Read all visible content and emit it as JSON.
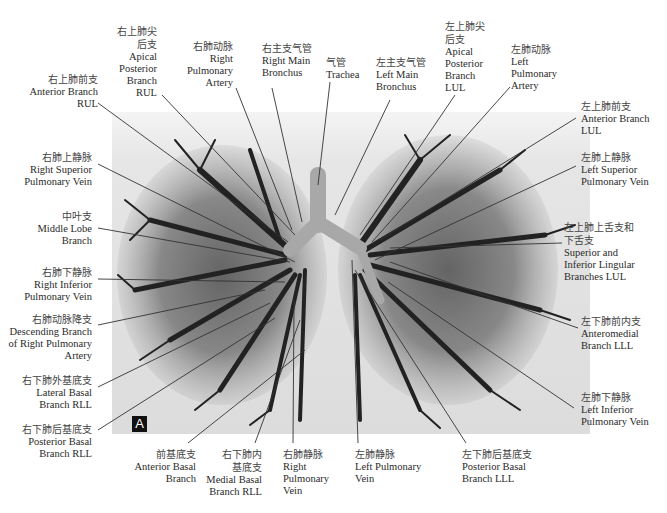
{
  "figure": {
    "panel_letter": "A",
    "colors": {
      "background": "#ffffff",
      "photo_bg": "#e4e4e4",
      "cast_dark": "#1e1e1e",
      "cast_mid": "#5a5a5a",
      "airway": "#9a9a9a",
      "leader": "#333333"
    }
  },
  "labels": [
    {
      "id": "ant-branch-rul",
      "zh": "右上肺前支",
      "en": [
        "Anterior Branch",
        "RUL"
      ]
    },
    {
      "id": "apical-post-rul",
      "zh": "右上肺尖后支",
      "en": [
        "Apical",
        "Posterior",
        "Branch",
        "RUL"
      ]
    },
    {
      "id": "right-pulm-artery",
      "zh": "右肺动脉",
      "en": [
        "Right",
        "Pulmonary",
        "Artery"
      ]
    },
    {
      "id": "right-main-bronchus",
      "zh": "右主支气管",
      "en": [
        "Right Main",
        "Bronchus"
      ]
    },
    {
      "id": "trachea",
      "zh": "气管",
      "en": [
        "Trachea"
      ]
    },
    {
      "id": "left-main-bronchus",
      "zh": "左主支气管",
      "en": [
        "Left Main",
        "Bronchus"
      ]
    },
    {
      "id": "apical-post-lul",
      "zh": "左上肺尖后支",
      "en": [
        "Apical",
        "Posterior",
        "Branch",
        "LUL"
      ]
    },
    {
      "id": "left-pulm-artery",
      "zh": "左肺动脉",
      "en": [
        "Left",
        "Pulmonary",
        "Artery"
      ]
    },
    {
      "id": "ant-branch-lul",
      "zh": "左上肺前支",
      "en": [
        "Anterior Branch",
        "LUL"
      ]
    },
    {
      "id": "left-sup-pulm-vein",
      "zh": "左肺上静脉",
      "en": [
        "Left Superior",
        "Pulmonary Vein"
      ]
    },
    {
      "id": "lingular-lul",
      "zh": "左上肺上舌支和下舌支",
      "en": [
        "Superior and",
        "Inferior Lingular",
        "Branches LUL"
      ]
    },
    {
      "id": "anteromedial-lll",
      "zh": "左下肺前内支",
      "en": [
        "Anteromedial",
        "Branch LLL"
      ]
    },
    {
      "id": "left-inf-pulm-vein",
      "zh": "左肺下静脉",
      "en": [
        "Left Inferior",
        "Pulmonary Vein"
      ]
    },
    {
      "id": "right-sup-pulm-vein",
      "zh": "右肺上静脉",
      "en": [
        "Right Superior",
        "Pulmonary Vein"
      ]
    },
    {
      "id": "middle-lobe",
      "zh": "中叶支",
      "en": [
        "Middle Lobe",
        "Branch"
      ]
    },
    {
      "id": "right-inf-pulm-vein",
      "zh": "右肺下静脉",
      "en": [
        "Right Inferior",
        "Pulmonary Vein"
      ]
    },
    {
      "id": "desc-right-pulm-artery",
      "zh": "右肺动脉降支",
      "en": [
        "Descending Branch",
        "of Right Pulmonary",
        "Artery"
      ]
    },
    {
      "id": "lat-basal-rll",
      "zh": "右下肺外基底支",
      "en": [
        "Lateral Basal",
        "Branch RLL"
      ]
    },
    {
      "id": "post-basal-rll",
      "zh": "右下肺后基底支",
      "en": [
        "Posterior Basal",
        "Branch RLL"
      ]
    },
    {
      "id": "ant-basal",
      "zh": "前基底支",
      "en": [
        "Anterior Basal",
        "Branch"
      ]
    },
    {
      "id": "medial-basal-rll",
      "zh": "右下肺内基底支",
      "en": [
        "Medial Basal",
        "Branch RLL"
      ]
    },
    {
      "id": "right-pulm-vein",
      "zh": "右肺静脉",
      "en": [
        "Right",
        "Pulmonary",
        "Vein"
      ]
    },
    {
      "id": "left-pulm-vein",
      "zh": "左肺静脉",
      "en": [
        "Left Pulmonary",
        "Vein"
      ]
    },
    {
      "id": "post-basal-lll",
      "zh": "左下肺后基底支",
      "en": [
        "Posterior Basal",
        "Branch LLL"
      ]
    }
  ],
  "label_text": {
    "ant_rul": {
      "zh": "右上肺前支",
      "en1": "Anterior Branch",
      "en2": "RUL"
    },
    "apical_rul": {
      "zh1": "右上肺尖",
      "zh2": "后支",
      "en1": "Apical",
      "en2": "Posterior",
      "en3": "Branch",
      "en4": "RUL"
    },
    "rpa": {
      "zh": "右肺动脉",
      "en1": "Right",
      "en2": "Pulmonary",
      "en3": "Artery"
    },
    "rmb": {
      "zh": "右主支气管",
      "en1": "Right Main",
      "en2": "Bronchus"
    },
    "trachea": {
      "zh": "气管",
      "en1": "Trachea"
    },
    "lmb": {
      "zh": "左主支气管",
      "en1": "Left Main",
      "en2": "Bronchus"
    },
    "apical_lul": {
      "zh1": "左上肺尖",
      "zh2": "后支",
      "en1": "Apical",
      "en2": "Posterior",
      "en3": "Branch",
      "en4": "LUL"
    },
    "lpa": {
      "zh": "左肺动脉",
      "en1": "Left",
      "en2": "Pulmonary",
      "en3": "Artery"
    },
    "ant_lul": {
      "zh": "左上肺前支",
      "en1": "Anterior Branch",
      "en2": "LUL"
    },
    "lspv": {
      "zh": "左肺上静脉",
      "en1": "Left Superior",
      "en2": "Pulmonary Vein"
    },
    "ling": {
      "zh1": "左上肺上舌支和",
      "zh2": "下舌支",
      "en1": "Superior and",
      "en2": "Inferior Lingular",
      "en3": "Branches LUL"
    },
    "antmed_lll": {
      "zh": "左下肺前内支",
      "en1": "Anteromedial",
      "en2": "Branch LLL"
    },
    "lipv": {
      "zh": "左肺下静脉",
      "en1": "Left Inferior",
      "en2": "Pulmonary Vein"
    },
    "rspv": {
      "zh": "右肺上静脉",
      "en1": "Right Superior",
      "en2": "Pulmonary Vein"
    },
    "middle": {
      "zh": "中叶支",
      "en1": "Middle Lobe",
      "en2": "Branch"
    },
    "ripv": {
      "zh": "右肺下静脉",
      "en1": "Right Inferior",
      "en2": "Pulmonary Vein"
    },
    "desc_rpa": {
      "zh": "右肺动脉降支",
      "en1": "Descending Branch",
      "en2": "of Right Pulmonary",
      "en3": "Artery"
    },
    "lat_rll": {
      "zh": "右下肺外基底支",
      "en1": "Lateral Basal",
      "en2": "Branch RLL"
    },
    "post_rll": {
      "zh": "右下肺后基底支",
      "en1": "Posterior Basal",
      "en2": "Branch RLL"
    },
    "ant_basal": {
      "zh": "前基底支",
      "en1": "Anterior Basal",
      "en2": "Branch"
    },
    "med_rll": {
      "zh1": "右下肺内",
      "zh2": "基底支",
      "en1": "Medial Basal",
      "en2": "Branch RLL"
    },
    "rpv": {
      "zh": "右肺静脉",
      "en1": "Right",
      "en2": "Pulmonary",
      "en3": "Vein"
    },
    "lpv": {
      "zh": "左肺静脉",
      "en1": "Left Pulmonary",
      "en2": "Vein"
    },
    "post_lll": {
      "zh": "左下肺后基底支",
      "en1": "Posterior Basal",
      "en2": "Branch LLL"
    }
  }
}
